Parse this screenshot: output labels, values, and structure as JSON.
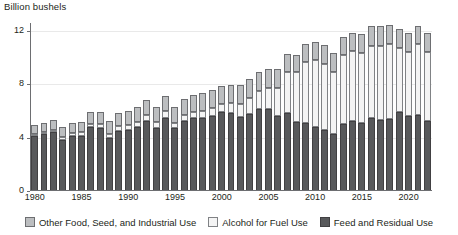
{
  "chart_data": {
    "type": "bar",
    "stacked": true,
    "title": "",
    "ylabel": "Billion bushels",
    "xlabel": "",
    "ylim": [
      0,
      12.6
    ],
    "yticks": [
      0,
      4,
      8,
      12
    ],
    "ytick_labels": [
      "0",
      "4",
      "8",
      "12"
    ],
    "xticks": [
      1980,
      1985,
      1990,
      1995,
      2000,
      2005,
      2010,
      2015,
      2020
    ],
    "xtick_labels": [
      "1980",
      "1985",
      "1990",
      "1995",
      "2000",
      "2005",
      "2010",
      "2015",
      "2020"
    ],
    "grid": "horizontal",
    "legend_position": "bottom",
    "categories": [
      1980,
      1981,
      1982,
      1983,
      1984,
      1985,
      1986,
      1987,
      1988,
      1989,
      1990,
      1991,
      1992,
      1993,
      1994,
      1995,
      1996,
      1997,
      1998,
      1999,
      2000,
      2001,
      2002,
      2003,
      2004,
      2005,
      2006,
      2007,
      2008,
      2009,
      2010,
      2011,
      2012,
      2013,
      2014,
      2015,
      2016,
      2017,
      2018,
      2019,
      2020,
      2021,
      2022
    ],
    "series": [
      {
        "name": "Feed and Residual Use",
        "color": "#58595b",
        "values": [
          4.14,
          4.24,
          4.46,
          3.86,
          4.11,
          4.12,
          4.78,
          4.71,
          4.0,
          4.52,
          4.59,
          4.79,
          5.25,
          4.7,
          5.46,
          4.69,
          5.28,
          5.48,
          5.5,
          5.66,
          5.9,
          5.86,
          5.56,
          5.8,
          6.16,
          6.15,
          5.6,
          5.86,
          5.18,
          5.13,
          4.79,
          4.54,
          4.31,
          5.04,
          5.28,
          5.11,
          5.47,
          5.3,
          5.43,
          5.9,
          5.6,
          5.67,
          5.28
        ]
      },
      {
        "name": "Alcohol for Fuel Use",
        "color": "#f4f4f4",
        "values": [
          0.04,
          0.08,
          0.14,
          0.17,
          0.23,
          0.28,
          0.28,
          0.29,
          0.31,
          0.32,
          0.35,
          0.4,
          0.43,
          0.46,
          0.53,
          0.4,
          0.43,
          0.48,
          0.53,
          0.57,
          0.63,
          0.71,
          1.0,
          1.17,
          1.32,
          1.6,
          2.12,
          3.03,
          3.71,
          4.57,
          5.02,
          5.01,
          4.64,
          5.13,
          5.2,
          5.22,
          5.43,
          5.61,
          5.61,
          4.86,
          4.86,
          5.32,
          5.18
        ]
      },
      {
        "name": "Other Food, Seed, and Industrial Use",
        "color": "#bcbec0",
        "values": [
          0.66,
          0.69,
          0.7,
          0.74,
          0.78,
          0.81,
          0.87,
          0.9,
          0.95,
          1.0,
          1.05,
          1.08,
          1.11,
          1.14,
          1.17,
          1.2,
          1.22,
          1.25,
          1.3,
          1.34,
          1.37,
          1.39,
          1.4,
          1.41,
          1.42,
          1.4,
          1.4,
          1.36,
          1.3,
          1.32,
          1.4,
          1.43,
          1.4,
          1.37,
          1.39,
          1.42,
          1.45,
          1.45,
          1.43,
          1.4,
          1.42,
          1.41,
          1.4
        ]
      }
    ]
  },
  "legend": {
    "items": [
      {
        "label": "Other Food, Seed, and Industrial Use",
        "swatch": "other"
      },
      {
        "label": "Alcohol for Fuel Use",
        "swatch": "alcohol"
      },
      {
        "label": "Feed and Residual Use",
        "swatch": "feed"
      }
    ]
  }
}
